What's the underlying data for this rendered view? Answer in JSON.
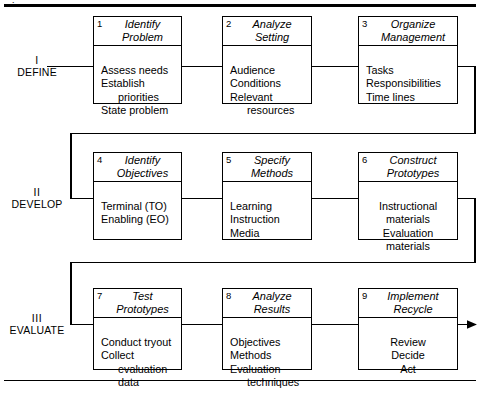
{
  "diagram": {
    "arrow_label": "process-output-arrow"
  },
  "phases": [
    {
      "numeral": "I",
      "name": "DEFINE"
    },
    {
      "numeral": "II",
      "name": "DEVELOP"
    },
    {
      "numeral": "III",
      "name": "EVALUATE"
    }
  ],
  "boxes": [
    {
      "num": "1",
      "title_lines": [
        "Identify",
        "Problem"
      ],
      "items": [
        "Assess needs",
        "Establish",
        "priorities",
        "State problem"
      ],
      "indent": [
        false,
        false,
        true,
        false
      ],
      "align": "left"
    },
    {
      "num": "2",
      "title_lines": [
        "Analyze",
        "Setting"
      ],
      "items": [
        "Audience",
        "Conditions",
        "Relevant",
        "resources"
      ],
      "indent": [
        false,
        false,
        false,
        true
      ],
      "align": "left"
    },
    {
      "num": "3",
      "title_lines": [
        "Organize",
        "Management"
      ],
      "items": [
        "Tasks",
        "Responsibilities",
        "Time lines"
      ],
      "indent": [
        false,
        false,
        false
      ],
      "align": "left"
    },
    {
      "num": "4",
      "title_lines": [
        "Identify",
        "Objectives"
      ],
      "items": [
        "Terminal (TO)",
        "Enabling (EO)"
      ],
      "indent": [
        false,
        false
      ],
      "align": "left"
    },
    {
      "num": "5",
      "title_lines": [
        "Specify",
        "Methods"
      ],
      "items": [
        "Learning",
        "Instruction",
        "Media"
      ],
      "indent": [
        false,
        false,
        false
      ],
      "align": "left"
    },
    {
      "num": "6",
      "title_lines": [
        "Construct",
        "Prototypes"
      ],
      "items": [
        "Instructional",
        "materials",
        "Evaluation",
        "materials"
      ],
      "indent": [
        false,
        true,
        false,
        true
      ],
      "align": "cent"
    },
    {
      "num": "7",
      "title_lines": [
        "Test",
        "Prototypes"
      ],
      "items": [
        "Conduct tryout",
        "Collect",
        "evaluation",
        "data"
      ],
      "indent": [
        false,
        false,
        true,
        true
      ],
      "align": "left"
    },
    {
      "num": "8",
      "title_lines": [
        "Analyze",
        "Results"
      ],
      "items": [
        "Objectives",
        "Methods",
        "Evaluation",
        "techniques"
      ],
      "indent": [
        false,
        false,
        false,
        true
      ],
      "align": "left"
    },
    {
      "num": "9",
      "title_lines": [
        "Implement",
        "Recycle"
      ],
      "items": [
        "Review",
        "Decide",
        "Act"
      ],
      "indent": [
        false,
        false,
        false
      ],
      "align": "cent"
    }
  ],
  "colors": {
    "ink": "#000000",
    "paper": "#ffffff"
  }
}
